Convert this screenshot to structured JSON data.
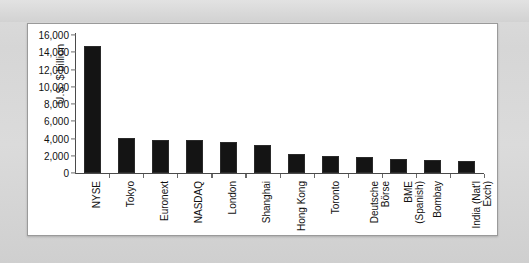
{
  "figure": {
    "panel_background": "#ffffff",
    "page_background": "#d9d9d9",
    "bar_color": "#141414",
    "axis_color": "#4a4a4a"
  },
  "chart_data": {
    "type": "bar",
    "title": "",
    "xlabel": "",
    "ylabel": "U.S. $ billion",
    "ylim": [
      0,
      16000
    ],
    "ytick_step": 2000,
    "ytick_labels": [
      "16,000",
      "14,000",
      "12,000",
      "10,000",
      "8,000",
      "6,000",
      "4,000",
      "2,000",
      "0"
    ],
    "ytick_values": [
      16000,
      14000,
      12000,
      10000,
      8000,
      6000,
      4000,
      2000,
      0
    ],
    "grid": false,
    "legend": null,
    "categories": [
      "NYSE",
      "Tokyo",
      "Euronext",
      "NASDAQ",
      "London",
      "Shanghai",
      "Hong Kong",
      "Toronto",
      "Deutsche Börse",
      "BME (Spanish)",
      "Bombay",
      "India (Nat'l Exch)"
    ],
    "category_label_lines": [
      [
        "NYSE"
      ],
      [
        "Tokyo"
      ],
      [
        "Euronext"
      ],
      [
        "NASDAQ"
      ],
      [
        "London"
      ],
      [
        "Shanghai"
      ],
      [
        "Hong Kong"
      ],
      [
        "Toronto"
      ],
      [
        "Deutsche",
        "Börse"
      ],
      [
        "BME",
        "(Spanish)"
      ],
      [
        "Bombay"
      ],
      [
        "India (Nat'l",
        "Exch)"
      ]
    ],
    "values": [
      14700,
      4100,
      3800,
      3800,
      3600,
      3200,
      2200,
      2000,
      1800,
      1600,
      1500,
      1400
    ]
  }
}
